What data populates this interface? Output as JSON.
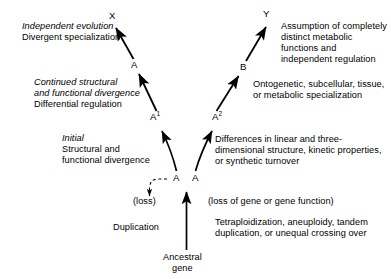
{
  "figure": {
    "ink_color": "#000000",
    "background_color": "#ffffff"
  },
  "nodes": {
    "x": "X",
    "y": "Y",
    "a_upper_left": "A",
    "b_upper_right": "B",
    "a1_base": "A",
    "a1_sup": "1",
    "a2_base": "A",
    "a2_sup": "2",
    "a_center_left": "A",
    "a_center_right": "A",
    "loss": "(loss)"
  },
  "labels_left": {
    "tier1_italic": "Independent evolution",
    "tier1_roman": "Divergent specialization",
    "tier2_italic_line1": "Continued structural",
    "tier2_italic_line2": "and functional divergence",
    "tier2_roman": "Differential regulation",
    "tier3_italic": "Initial",
    "tier3_roman_line1": "Structural and",
    "tier3_roman_line2": "functional divergence",
    "duplication": "Duplication"
  },
  "labels_right": {
    "tier1_line1": "Assumption of completely",
    "tier1_line2": "distinct metabolic",
    "tier1_line3": "functions and",
    "tier1_line4": "independent regulation",
    "tier2_line1": "Ontogenetic, subcellular, tissue,",
    "tier2_line2": "or metabolic specialization",
    "tier3_line1": "Differences in linear and three-",
    "tier3_line2": "dimensional structure, kinetic properties,",
    "tier3_line3": "or synthetic turnover",
    "loss_note": "(loss of gene or gene function)",
    "mechanism_line1": "Tetraploidization, aneuploidy, tandem",
    "mechanism_line2": "duplication, or unequal crossing over"
  },
  "labels_bottom": {
    "ancestral_line1": "Ancestral",
    "ancestral_line2": "gene"
  }
}
